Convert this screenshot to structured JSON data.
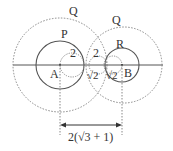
{
  "diagram": {
    "labels": {
      "q_left": "Q",
      "q_right": "Q",
      "p": "P",
      "r": "R",
      "a": "A",
      "b": "B",
      "radius_a": "2",
      "radius_mid": "2",
      "sqrt2_left": "√2",
      "sqrt2_right": "√2",
      "distance": "2(√3 + 1)"
    },
    "colors": {
      "stroke": "#555555",
      "dotted": "#888888",
      "text": "#333333"
    }
  }
}
